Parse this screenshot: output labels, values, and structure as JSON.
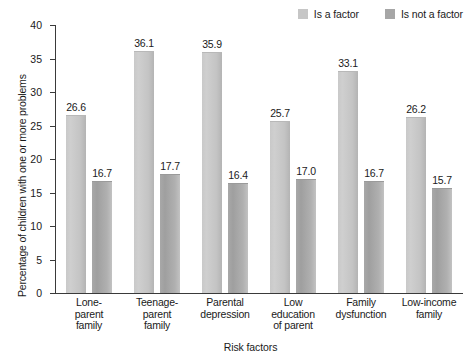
{
  "chart_data": {
    "type": "bar",
    "title": "",
    "xlabel": "Risk factors",
    "ylabel": "Percentage of children with one or more problems",
    "ylim": [
      0,
      40
    ],
    "yticks": [
      "0",
      "5",
      "10",
      "15",
      "20",
      "25",
      "30",
      "35",
      "40"
    ],
    "grid": false,
    "legend_position": "top-right",
    "categories": [
      "Lone-\nparent\nfamily",
      "Teenage-\nparent\nfamily",
      "Parental\ndepression",
      "Low\neducation\nof parent",
      "Family\ndysfunction",
      "Low-income\nfamily"
    ],
    "category_lines": [
      [
        "Lone-",
        "parent",
        "family"
      ],
      [
        "Teenage-",
        "parent",
        "family"
      ],
      [
        "Parental",
        "depression"
      ],
      [
        "Low",
        "education",
        "of parent"
      ],
      [
        "Family",
        "dysfunction"
      ],
      [
        "Low-income",
        "family"
      ]
    ],
    "series": [
      {
        "name": "Is a factor",
        "color": "#c6c6c6",
        "values": [
          26.6,
          36.1,
          35.9,
          25.7,
          33.1,
          26.2
        ],
        "labels": [
          "26.6",
          "36.1",
          "35.9",
          "25.7",
          "33.1",
          "26.2"
        ]
      },
      {
        "name": "Is not a factor",
        "color": "#a6a6a6",
        "values": [
          16.7,
          17.7,
          16.4,
          17.0,
          16.7,
          15.7
        ],
        "labels": [
          "16.7",
          "17.7",
          "16.4",
          "17.0",
          "16.7",
          "15.7"
        ]
      }
    ]
  },
  "legend": {
    "items": [
      {
        "label": "Is a factor",
        "color": "#c6c6c6"
      },
      {
        "label": "Is not a factor",
        "color": "#a6a6a6"
      }
    ]
  },
  "axes": {
    "y_title": "Percentage of children with one or more problems",
    "x_title": "Risk factors"
  }
}
